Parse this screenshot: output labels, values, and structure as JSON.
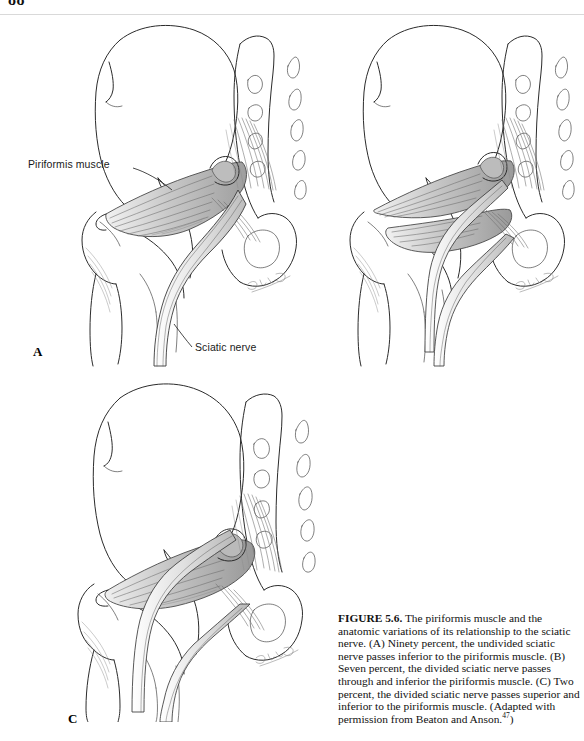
{
  "page": {
    "folio": "88"
  },
  "figure": {
    "panels": [
      {
        "letter": "A",
        "name": "panel-a",
        "description": "Ninety percent, the undivided sciatic nerve passes inferior to the piriformis muscle."
      },
      {
        "letter": "B",
        "name": "panel-b",
        "description": "Seven percent, the divided sciatic nerve passes through and inferior the piriformis muscle."
      },
      {
        "letter": "C",
        "name": "panel-c",
        "description": "Two percent, the divided sciatic nerve passes superior and inferior to the piriformis muscle."
      }
    ],
    "callouts": [
      {
        "name": "piriformis-muscle",
        "text": "Piriformis muscle"
      },
      {
        "name": "sciatic-nerve",
        "text": "Sciatic nerve"
      }
    ],
    "artist_signature": "© M.D. Cook",
    "caption": {
      "figure_number": "FIGURE 5.6.",
      "body": "The piriformis muscle and the anatomic variations of its relationship to the sciatic nerve. (A) Ninety percent, the undivided sciatic nerve passes inferior to the piriformis muscle. (B) Seven percent, the divided sciatic nerve passes through and inferior the piriformis muscle. (C) Two percent, the divided sciatic nerve passes superior and inferior to the piriformis muscle. (Adapted with permission from Beaton and Anson.",
      "reference_superscript": "47",
      "closing": ")"
    }
  },
  "colors": {
    "ink": "#2b2b2b",
    "fiber": "#6a6a6a",
    "paper": "#ffffff",
    "text": "#111111"
  }
}
